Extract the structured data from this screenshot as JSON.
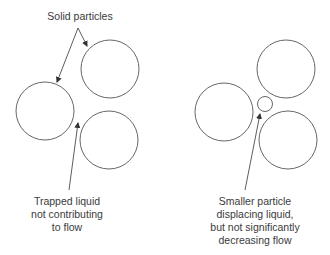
{
  "labels": {
    "solid_particles": "Solid particles",
    "trapped_liquid": [
      "Trapped liquid",
      "not contributing",
      "to flow"
    ],
    "smaller_particle": [
      "Smaller particle",
      "displacing liquid,",
      "but not significantly",
      "decreasing flow"
    ]
  },
  "colors": {
    "stroke": "#555555",
    "text": "#3a3a3a"
  }
}
